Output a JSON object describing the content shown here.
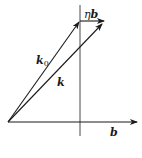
{
  "diagram": {
    "type": "vector-diagram",
    "colors": {
      "stroke": "#1a1a1a",
      "background": "#ffffff"
    },
    "origin": [
      8,
      122
    ],
    "vectors": [
      {
        "id": "k0",
        "from": [
          8,
          122
        ],
        "to": [
          80,
          21
        ],
        "label": "k",
        "label_sub": "0"
      },
      {
        "id": "eta_b",
        "from": [
          80,
          21
        ],
        "to": [
          105,
          21
        ],
        "label_prefix": "η",
        "label": "b"
      },
      {
        "id": "k",
        "from": [
          8,
          122
        ],
        "to": [
          103,
          23
        ],
        "label": "k"
      },
      {
        "id": "b",
        "from": [
          8,
          122
        ],
        "to": [
          138,
          122
        ],
        "label": "b"
      }
    ],
    "reference_line": {
      "x": 80,
      "y1": 5,
      "y2": 136
    },
    "labels": {
      "eta_b_prefix": "η",
      "eta_b_vec": "b",
      "k0_main": "k",
      "k0_sub": "0",
      "k": "k",
      "b": "b"
    }
  }
}
